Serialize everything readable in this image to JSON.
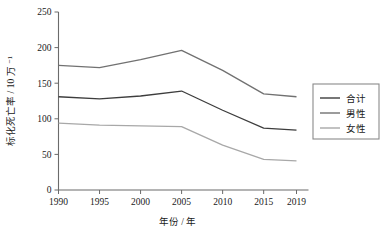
{
  "chart_data": {
    "type": "line",
    "title": "",
    "xlabel": "年份 / 年",
    "ylabel": "标化死亡率 / 10 万 ⁻¹",
    "x": [
      1990,
      1995,
      2000,
      2005,
      2010,
      2015,
      2019
    ],
    "categories": [
      "1990",
      "1995",
      "2000",
      "2005",
      "2010",
      "2015",
      "2019"
    ],
    "xlim": [
      1990,
      2019
    ],
    "ylim": [
      0,
      250
    ],
    "yticks": [
      0,
      50,
      100,
      150,
      200,
      250
    ],
    "ytick_labels": [
      "0",
      "50",
      "100",
      "150",
      "200",
      "250"
    ],
    "xticks": [
      1990,
      1995,
      2000,
      2005,
      2010,
      2015,
      2019
    ],
    "xtick_labels": [
      "1990",
      "1995",
      "2000",
      "2005",
      "2010",
      "2015",
      "2019"
    ],
    "grid": false,
    "legend_position": "right",
    "series": [
      {
        "name": "合计",
        "color": "#3d3d3d",
        "values": [
          131,
          128,
          132,
          139,
          112,
          87,
          84
        ]
      },
      {
        "name": "男性",
        "color": "#717171",
        "values": [
          175,
          172,
          183,
          196,
          168,
          135,
          131
        ]
      },
      {
        "name": "女性",
        "color": "#a8a8a8",
        "values": [
          94,
          91,
          90,
          89,
          63,
          43,
          41
        ]
      }
    ]
  },
  "axes": {
    "y_label": "标化死亡率 / 10 万 ⁻¹",
    "x_label": "年份 / 年"
  },
  "legend": {
    "items": [
      {
        "label": "合计",
        "color": "#3d3d3d"
      },
      {
        "label": "男性",
        "color": "#717171"
      },
      {
        "label": "女性",
        "color": "#a8a8a8"
      }
    ]
  },
  "colors": {
    "axis": "#6b6b6b",
    "text": "#1a1a1a",
    "legend_border": "#8a8a8a",
    "background": "#ffffff"
  }
}
